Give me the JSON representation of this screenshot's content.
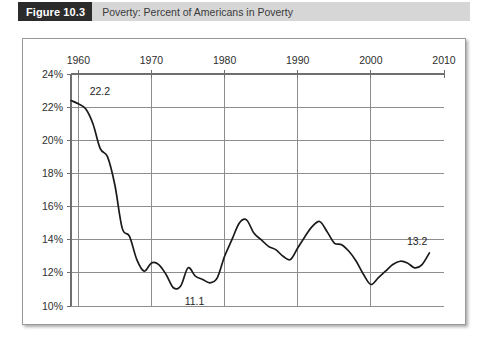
{
  "figure": {
    "badge_label": "Figure 10.3",
    "caption": "Poverty: Percent of Americans in Poverty"
  },
  "chart_data": {
    "type": "line",
    "title": "Poverty: Percent of Americans in Poverty",
    "xlabel": "",
    "ylabel": "",
    "xlim": [
      1959,
      2010
    ],
    "ylim": [
      10,
      24
    ],
    "grid": true,
    "legend": "none",
    "x_axis_position": "top",
    "y_tick_labels": [
      "10%",
      "12%",
      "14%",
      "16%",
      "18%",
      "20%",
      "22%",
      "24%"
    ],
    "y_ticks": [
      10,
      12,
      14,
      16,
      18,
      20,
      22,
      24
    ],
    "x_tick_labels": [
      "1960",
      "1970",
      "1980",
      "1990",
      "2000",
      "2010"
    ],
    "x_ticks": [
      1960,
      1970,
      1980,
      1990,
      2000,
      2010
    ],
    "series": [
      {
        "name": "Percent of Americans in Poverty",
        "x": [
          1959,
          1960,
          1961,
          1962,
          1963,
          1964,
          1965,
          1966,
          1967,
          1968,
          1969,
          1970,
          1971,
          1972,
          1973,
          1974,
          1975,
          1976,
          1977,
          1978,
          1979,
          1980,
          1981,
          1982,
          1983,
          1984,
          1985,
          1986,
          1987,
          1988,
          1989,
          1990,
          1991,
          1992,
          1993,
          1994,
          1995,
          1996,
          1997,
          1998,
          1999,
          2000,
          2001,
          2002,
          2003,
          2004,
          2005,
          2006,
          2007,
          2008
        ],
        "values": [
          22.4,
          22.2,
          21.9,
          21.0,
          19.5,
          19.0,
          17.3,
          14.7,
          14.2,
          12.8,
          12.1,
          12.6,
          12.5,
          11.9,
          11.1,
          11.2,
          12.3,
          11.8,
          11.6,
          11.4,
          11.7,
          13.0,
          14.0,
          15.0,
          15.2,
          14.4,
          14.0,
          13.6,
          13.4,
          13.0,
          12.8,
          13.5,
          14.2,
          14.8,
          15.1,
          14.5,
          13.8,
          13.7,
          13.3,
          12.7,
          11.9,
          11.3,
          11.7,
          12.1,
          12.5,
          12.7,
          12.6,
          12.3,
          12.5,
          13.2
        ]
      }
    ],
    "annotations": [
      {
        "label": "22.2",
        "x": 1961,
        "y": 22.2
      },
      {
        "label": "11.1",
        "x": 1974,
        "y": 11.1
      },
      {
        "label": "13.2",
        "x": 2008,
        "y": 13.2
      }
    ]
  }
}
